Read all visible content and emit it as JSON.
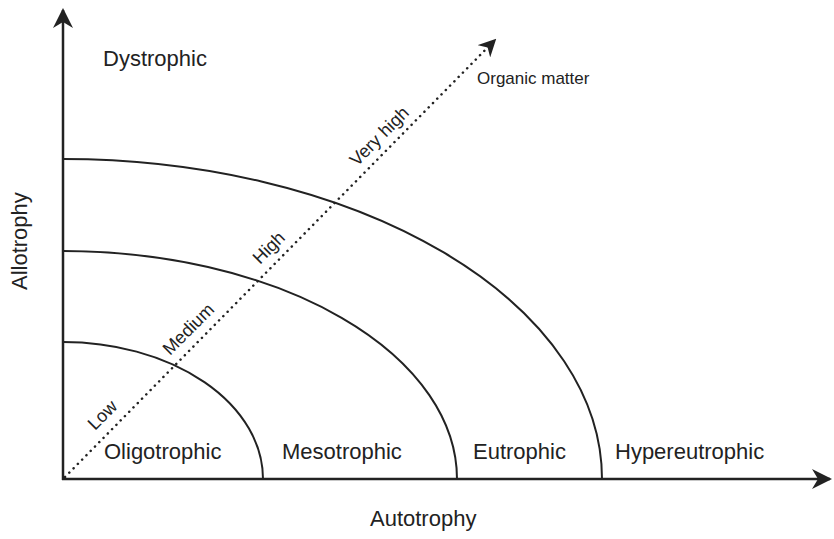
{
  "diagram": {
    "colors": {
      "background": "#ffffff",
      "ink": "#222222"
    },
    "axes": {
      "x_label": "Autotrophy",
      "y_label": "Allotrophy"
    },
    "regions": {
      "top_left": "Dystrophic",
      "zones": [
        "Oligotrophic",
        "Mesotrophic",
        "Eutrophic",
        "Hypereutrophic"
      ]
    },
    "gradient": {
      "label": "Organic matter",
      "levels": [
        "Low",
        "Medium",
        "High",
        "Very high"
      ],
      "style": "dotted-arrow"
    },
    "boundaries": [
      {
        "name": "oligo-meso",
        "y_intercept_px": 342,
        "x_intercept_px": 263
      },
      {
        "name": "meso-eu",
        "y_intercept_px": 251,
        "x_intercept_px": 457
      },
      {
        "name": "eu-hypereu",
        "y_intercept_px": 159,
        "x_intercept_px": 602
      }
    ]
  }
}
